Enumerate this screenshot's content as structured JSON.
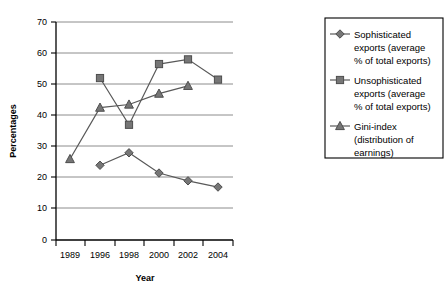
{
  "chart_data": {
    "type": "line",
    "title": "",
    "xlabel": "Year",
    "ylabel": "Percentages",
    "categories": [
      "1989",
      "1996",
      "1998",
      "2000",
      "2002",
      "2004"
    ],
    "x": [
      1989,
      1996,
      1998,
      2000,
      2002,
      2004
    ],
    "ylim": [
      0,
      70
    ],
    "ytick_step": 10,
    "yticks": [
      "0",
      "10",
      "20",
      "30",
      "40",
      "50",
      "60",
      "70"
    ],
    "grid": "horizontal",
    "legend_position": "right",
    "series": [
      {
        "name": "Sophisticated exports (average % of total exports)",
        "marker": "diamond",
        "color": "#767676",
        "values": [
          null,
          24,
          28,
          21.5,
          19,
          17
        ]
      },
      {
        "name": "Unsophisticated exports (average % of total exports)",
        "marker": "square",
        "color": "#767676",
        "values": [
          null,
          52,
          37,
          56.5,
          58,
          51.5
        ]
      },
      {
        "name": "Gini-index (distribution of earnings)",
        "marker": "triangle",
        "color": "#767676",
        "values": [
          26,
          42.5,
          43.5,
          47,
          49.5,
          null
        ]
      }
    ]
  },
  "legend": {
    "entries": [
      {
        "marker": "diamond",
        "line1": "Sophisticated",
        "line2": "exports (average",
        "line3": "% of total exports)"
      },
      {
        "marker": "square",
        "line1": "Unsophisticated",
        "line2": "exports (average",
        "line3": "% of total exports)"
      },
      {
        "marker": "triangle",
        "line1": "Gini-index",
        "line2": "(distribution of",
        "line3": "earnings)"
      }
    ]
  },
  "colors": {
    "marker_fill": "#767676",
    "marker_stroke": "#4d4d4d",
    "line": "#595959",
    "grid": "#808080",
    "axis": "#000000",
    "background": "#ffffff"
  }
}
